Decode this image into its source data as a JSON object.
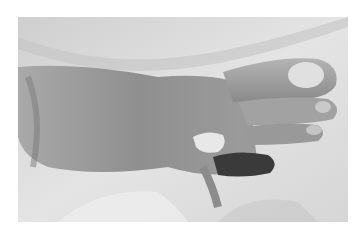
{
  "image": {
    "subject": "foot-photograph",
    "description": "Grayscale clinical photograph of a foot with a dark lesion on one toe",
    "colorscheme": "grayscale"
  }
}
